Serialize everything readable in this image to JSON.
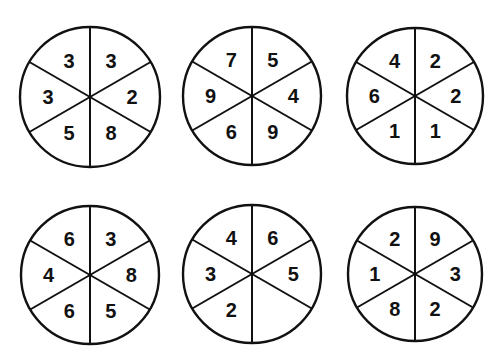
{
  "puzzle": {
    "segment_order": [
      "top-left",
      "top-right",
      "right",
      "bottom-right",
      "bottom-left",
      "left"
    ],
    "circles": [
      {
        "id": "circle-1",
        "values": [
          "3",
          "3",
          "2",
          "8",
          "5",
          "3"
        ]
      },
      {
        "id": "circle-2",
        "values": [
          "7",
          "5",
          "4",
          "9",
          "6",
          "9"
        ]
      },
      {
        "id": "circle-3",
        "values": [
          "4",
          "2",
          "2",
          "1",
          "1",
          "6"
        ]
      },
      {
        "id": "circle-4",
        "values": [
          "6",
          "3",
          "8",
          "5",
          "6",
          "4"
        ]
      },
      {
        "id": "circle-5",
        "values": [
          "4",
          "6",
          "5",
          "",
          "2",
          "3"
        ]
      },
      {
        "id": "circle-6",
        "values": [
          "2",
          "9",
          "3",
          "2",
          "8",
          "1"
        ]
      }
    ]
  }
}
